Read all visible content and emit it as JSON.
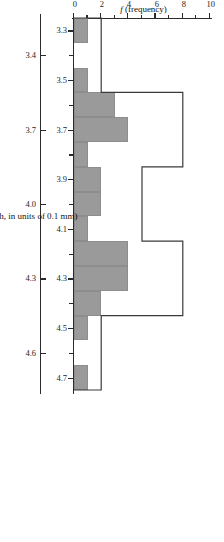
{
  "figure": {
    "rotation_note": "figure printed sideways on the page",
    "background_color": "#ffffff",
    "bar_fill_color": "#9a9a9a",
    "axis_color": "#2b2b2b",
    "outline_color": "#3a3a3a"
  },
  "chart_data": {
    "type": "bar",
    "title": "",
    "xlabel": "Y (femur length, in units of 0.1 mm)",
    "ylabel": "f (frequency)",
    "ylim": [
      0,
      10
    ],
    "xlim": [
      3.25,
      4.75
    ],
    "grid": false,
    "legend": "none",
    "y_ticks": [
      0,
      2,
      4,
      6,
      8,
      10
    ],
    "y_tick_labels": [
      "0",
      "2",
      "4",
      "6",
      "8",
      "10"
    ],
    "y_minor_ticks": [
      1,
      3,
      5,
      7,
      9
    ],
    "x_ticks_inner": [
      3.3,
      3.5,
      3.7,
      3.9,
      4.1,
      4.3,
      4.5,
      4.7
    ],
    "x_tick_labels_inner": [
      "3.3",
      "3.5",
      "3.7",
      "3.9",
      "4.1",
      "4.3",
      "4.5",
      "4.7"
    ],
    "x_minor_ticks_inner": [
      3.4,
      3.6,
      3.8,
      4.0,
      4.2,
      4.4,
      4.6
    ],
    "x_ticks_outer": [
      3.4,
      3.7,
      4.0,
      4.3,
      4.6
    ],
    "x_tick_labels_outer": [
      "3.4",
      "3.7",
      "4.0",
      "4.3",
      "4.6"
    ],
    "series": [
      {
        "name": "narrow-bin histogram",
        "style": "filled-gray",
        "bin_width": 0.1,
        "x": [
          3.3,
          3.4,
          3.5,
          3.6,
          3.7,
          3.8,
          3.9,
          4.0,
          4.1,
          4.2,
          4.3,
          4.4,
          4.5,
          4.6,
          4.7
        ],
        "values": [
          1,
          0,
          1,
          3,
          4,
          1,
          2,
          2,
          1,
          4,
          4,
          2,
          1,
          0,
          1
        ]
      },
      {
        "name": "wide-bin histogram outline",
        "style": "outline-white",
        "bin_width": 0.3,
        "bin_edges": [
          3.25,
          3.55,
          3.85,
          4.15,
          4.45,
          4.75
        ],
        "categories": [
          "3.4",
          "3.7",
          "4.0",
          "4.3",
          "4.6"
        ],
        "values": [
          2,
          8,
          5,
          8,
          2
        ]
      }
    ]
  },
  "labels": {
    "x_axis_title": "Y (femur length, in units of 0.1 mm)",
    "x_axis_title_symbol": "Y",
    "x_axis_title_rest": " (femur length, in units of 0.1 mm)",
    "y_axis_title": "f (frequency)",
    "y_axis_title_symbol": "f",
    "y_axis_title_rest": " (frequency)"
  }
}
